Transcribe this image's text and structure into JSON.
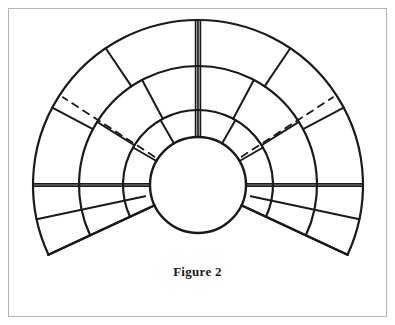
{
  "figure": {
    "caption": "Figure 2",
    "frame": {
      "border_color": "#b4b4b4",
      "background": "#ffffff"
    },
    "stroke_color": "#1a1a1a",
    "geometry": {
      "center_x": 198,
      "center_y": 185,
      "radii": [
        48,
        75,
        119,
        165
      ],
      "radius_labels": [
        "inner-circle",
        "arc-1",
        "arc-2",
        "outer-arc"
      ],
      "start_angle_deg": -25,
      "end_angle_deg": 205,
      "tail_angle_deg": 25
    },
    "bands": [
      {
        "name": "inner-band",
        "inner_radius": 48,
        "outer_radius": 75,
        "joint_angles_deg": [
          0,
          30,
          60,
          90,
          120,
          150,
          180
        ]
      },
      {
        "name": "middle-band",
        "inner_radius": 75,
        "outer_radius": 119,
        "joint_angles_deg": [
          0,
          32,
          62,
          90,
          118,
          148,
          180
        ]
      },
      {
        "name": "outer-band",
        "inner_radius": 119,
        "outer_radius": 165,
        "joint_angles_deg": [
          0,
          28,
          56,
          90,
          124,
          152,
          180
        ]
      }
    ],
    "tail_joints": [
      {
        "name": "left-tail-joints",
        "angles_deg": [
          180,
          192,
          205
        ]
      },
      {
        "name": "right-tail-joints",
        "angles_deg": [
          0,
          -12,
          -25
        ]
      }
    ],
    "key_joints": [
      {
        "name": "crown-joint",
        "angle_deg": 90,
        "style": "triple-line",
        "line_count": 3
      },
      {
        "name": "left-springing-joint",
        "angle_deg": 180,
        "style": "double-line",
        "line_count": 2
      },
      {
        "name": "right-springing-joint",
        "angle_deg": 0,
        "style": "double-line",
        "line_count": 2
      }
    ],
    "dashed_lines": [
      {
        "name": "left-dashed-radial",
        "angle_deg": 147,
        "from_radius": 48,
        "to_radius": 165,
        "style": "dashed"
      },
      {
        "name": "right-dashed-radial",
        "angle_deg": 33,
        "from_radius": 48,
        "to_radius": 165,
        "style": "dashed"
      }
    ]
  }
}
